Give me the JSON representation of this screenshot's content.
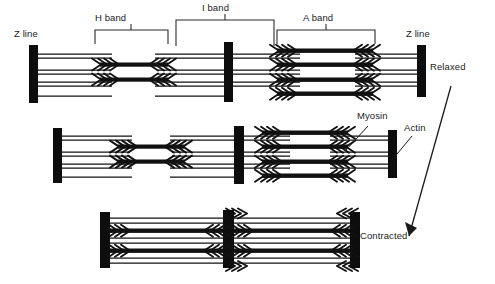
{
  "figure": {
    "colors": {
      "ink": "#1a1a1a",
      "filament": "#111111",
      "zline": "#0d0d0d",
      "background": "#ffffff",
      "bracket": "#2b2b2b"
    }
  },
  "band_labels": [
    {
      "id": "h-band",
      "text": "H band",
      "bracket_x1": 95,
      "bracket_x2": 168,
      "label_x": 111,
      "label_y": 17,
      "bracket_y": 30,
      "tick_y": 24
    },
    {
      "id": "i-band",
      "text": "I band",
      "bracket_x1": 176,
      "bracket_x2": 274,
      "label_x": 207,
      "label_y": 6,
      "bracket_y": 20,
      "tick_y": 14
    },
    {
      "id": "a-band",
      "text": "A band",
      "bracket_x1": 277,
      "bracket_x2": 375,
      "label_x": 305,
      "label_y": 17,
      "bracket_y": 30,
      "tick_y": 24
    }
  ],
  "zline_labels": [
    {
      "id": "z-line-left",
      "text": "Z line",
      "x": 16,
      "y": 32
    },
    {
      "id": "z-line-right",
      "text": "Z line",
      "x": 405,
      "y": 32
    }
  ],
  "filament_labels": [
    {
      "id": "myosin",
      "text": "Myosin",
      "x": 358,
      "y": 113,
      "leader": {
        "x1": 368,
        "y1": 126,
        "x2": 346,
        "y2": 150
      }
    },
    {
      "id": "actin",
      "text": "Actin",
      "x": 404,
      "y": 124,
      "leader": {
        "x1": 412,
        "y1": 136,
        "x2": 392,
        "y2": 160
      }
    }
  ],
  "state_labels": [
    {
      "id": "relaxed",
      "text": "Relaxed",
      "x": 430,
      "y": 64
    },
    {
      "id": "contracted",
      "text": "Contracted",
      "x": 362,
      "y": 232
    }
  ],
  "transition_arrow": {
    "id": "relaxed-to-contracted-arrow",
    "from_label": "Relaxed",
    "to_label": "Contracted",
    "x1": 451,
    "y1": 86,
    "x2": 409,
    "y2": 236
  },
  "rows": [
    {
      "id": "row-relaxed",
      "state": "Relaxed",
      "y_center": 74,
      "zlines": [
        33,
        228,
        421
      ],
      "sarcomere_count": 2
    },
    {
      "id": "row-intermediate",
      "state": "Partially contracted",
      "y_center": 155,
      "zlines": [
        57,
        238,
        392
      ],
      "sarcomere_count": 2
    },
    {
      "id": "row-contracted",
      "state": "Contracted",
      "y_center": 239,
      "zlines": [
        104,
        228,
        354
      ],
      "sarcomere_count": 2
    }
  ]
}
